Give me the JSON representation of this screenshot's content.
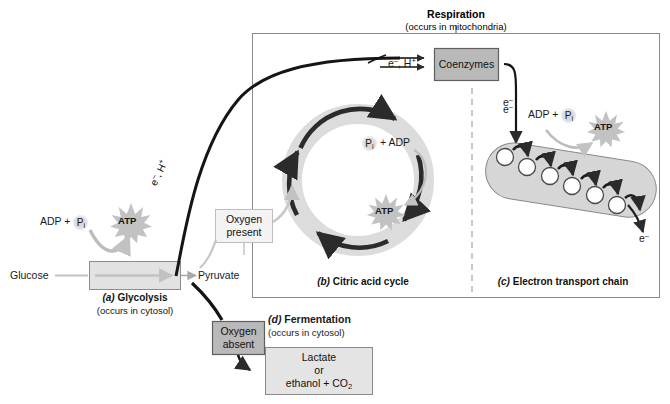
{
  "diagram": {
    "title": "Respiration",
    "title_sub": "(occurs in mitochondria)"
  },
  "glycolysis": {
    "input_label": "Glucose",
    "output_label": "Pyruvate",
    "caption_tag": "(a)",
    "caption_name": "Glycolysis",
    "caption_sub": "(occurs in cytosol)",
    "adp_label": "ADP +",
    "pi_label": "P",
    "pi_sub": "i",
    "atp_label": "ATP"
  },
  "transfer": {
    "electron_label_a": "e",
    "electron_sup_a": "–",
    "electron_label_b": ", H",
    "electron_sup_b": "+",
    "coenzymes_label": "Coenzymes",
    "coenzyme_input_label": "e–, H+",
    "electron_out_label": "e",
    "electron_out_sup": "–"
  },
  "oxygen": {
    "present_line1": "Oxygen",
    "present_line2": "present",
    "absent_line1": "Oxygen",
    "absent_line2": "absent"
  },
  "citric": {
    "pi_label": "P",
    "pi_sub": "i",
    "adp_label": "+ ADP",
    "atp_label": "ATP",
    "caption_tag": "(b)",
    "caption_name": "Citric acid cycle"
  },
  "etc": {
    "electron_in_label": "e",
    "electron_in_sup": "–",
    "adp_label": "ADP +",
    "pi_label": "P",
    "pi_sub": "i",
    "atp_label": "ATP",
    "electron_out_label": "e",
    "electron_out_sup": "–",
    "caption_tag": "(c)",
    "caption_name": "Electron transport chain",
    "carrier_count": 6
  },
  "fermentation": {
    "caption_tag": "(d)",
    "caption_name": "Fermentation",
    "caption_sub": "(occurs in cytosol)",
    "product_line1": "Lactate",
    "product_line2": "or",
    "product_line3_a": "ethanol + CO",
    "product_line3_sub": "2"
  },
  "colors": {
    "grey_box_fill": "#b9b9b9",
    "grey_box_stroke": "#6d6d6d",
    "pale_box_fill": "#e4e4e4",
    "light_box_fill": "#f3f3f3",
    "ring_fill": "#dcdcdc",
    "dark_arrow": "#2b2b2b",
    "light_arrow": "#c7c7c7",
    "frame_stroke": "#808080",
    "text": "#1a1a1a"
  }
}
